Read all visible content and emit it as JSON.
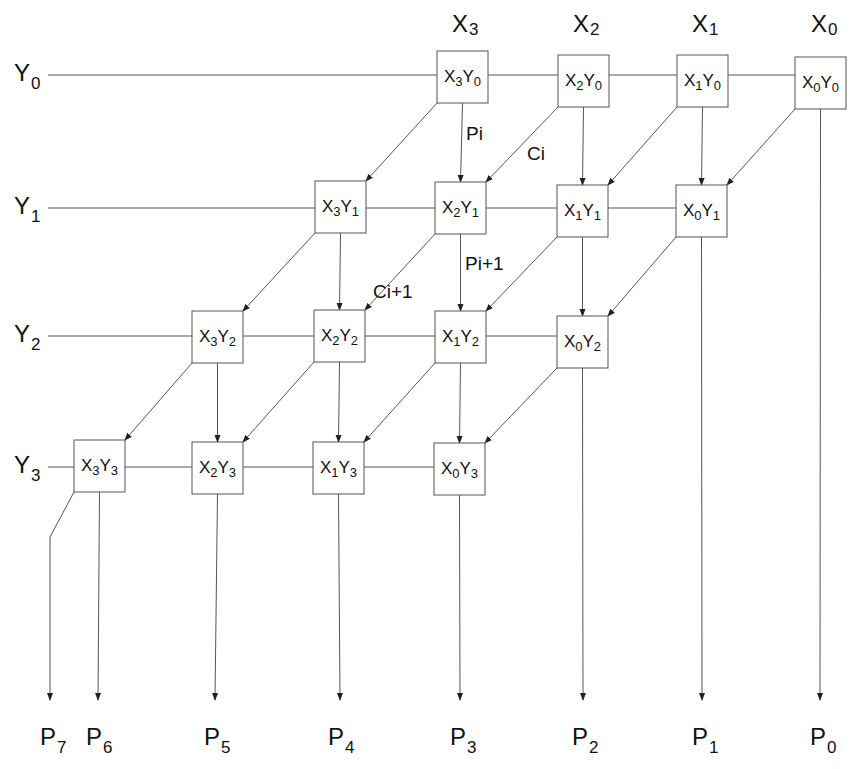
{
  "diagram": {
    "columns": [
      {
        "label": "X",
        "sub": "3"
      },
      {
        "label": "X",
        "sub": "2"
      },
      {
        "label": "X",
        "sub": "1"
      },
      {
        "label": "X",
        "sub": "0"
      }
    ],
    "rows": [
      {
        "label": "Y",
        "sub": "0"
      },
      {
        "label": "Y",
        "sub": "1"
      },
      {
        "label": "Y",
        "sub": "2"
      },
      {
        "label": "Y",
        "sub": "3"
      }
    ],
    "cells": [
      [
        {
          "x": "3",
          "y": "0"
        },
        {
          "x": "2",
          "y": "0"
        },
        {
          "x": "1",
          "y": "0"
        },
        {
          "x": "0",
          "y": "0"
        }
      ],
      [
        {
          "x": "3",
          "y": "1"
        },
        {
          "x": "2",
          "y": "1"
        },
        {
          "x": "1",
          "y": "1"
        },
        {
          "x": "0",
          "y": "1"
        }
      ],
      [
        {
          "x": "3",
          "y": "2"
        },
        {
          "x": "2",
          "y": "2"
        },
        {
          "x": "1",
          "y": "2"
        },
        {
          "x": "0",
          "y": "2"
        }
      ],
      [
        {
          "x": "3",
          "y": "3"
        },
        {
          "x": "2",
          "y": "3"
        },
        {
          "x": "1",
          "y": "3"
        },
        {
          "x": "0",
          "y": "3"
        }
      ]
    ],
    "outputs": [
      {
        "label": "P",
        "sub": "7"
      },
      {
        "label": "P",
        "sub": "6"
      },
      {
        "label": "P",
        "sub": "5"
      },
      {
        "label": "P",
        "sub": "4"
      },
      {
        "label": "P",
        "sub": "3"
      },
      {
        "label": "P",
        "sub": "2"
      },
      {
        "label": "P",
        "sub": "1"
      },
      {
        "label": "P",
        "sub": "0"
      }
    ],
    "annotations": {
      "pi": "Pi",
      "ci": "Ci",
      "pi1": "Pi+1",
      "ci1": "Ci+1"
    }
  }
}
